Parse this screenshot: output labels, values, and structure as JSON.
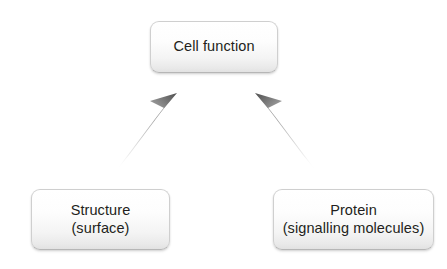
{
  "diagram": {
    "background_color": "#ffffff",
    "text_color": "#231f20",
    "node_border_color": "#cfcfcf",
    "arrow_color_dark": "#6e6e6e",
    "arrow_color_light": "#f2f2f2",
    "nodes": [
      {
        "id": "cell-function",
        "label": "Cell function",
        "role": "outcome",
        "x": 150,
        "y": 21,
        "width": 128,
        "height": 52
      },
      {
        "id": "structure",
        "label": "Structure\n(surface)",
        "role": "input",
        "x": 31,
        "y": 189,
        "width": 139,
        "height": 61
      },
      {
        "id": "protein",
        "label": "Protein\n(signalling molecules)",
        "role": "input",
        "x": 273,
        "y": 189,
        "width": 161,
        "height": 61
      }
    ],
    "edges": [
      {
        "id": "structure-to-cell-function",
        "from": "structure",
        "to": "cell-function",
        "style": "tapered-gradient-arrow",
        "direction": "up-right",
        "tip_x": 176,
        "tip_y": 94,
        "tail_x": 126,
        "tail_y": 166
      },
      {
        "id": "protein-to-cell-function",
        "from": "protein",
        "to": "cell-function",
        "style": "tapered-gradient-arrow",
        "direction": "up-left",
        "tip_x": 256,
        "tip_y": 94,
        "tail_x": 306,
        "tail_y": 166
      }
    ]
  }
}
